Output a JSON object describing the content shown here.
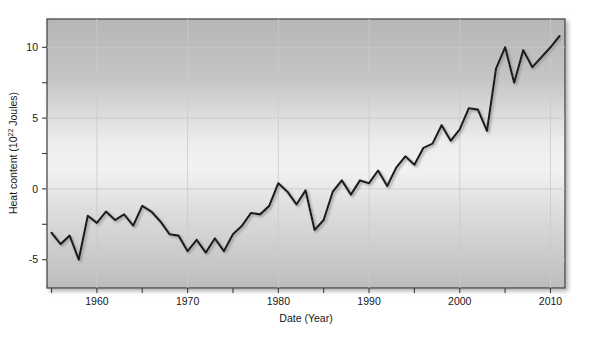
{
  "figure": {
    "background_color": "#ffffff",
    "plot_border_color": "#3b3b3b",
    "gridline_color": "#c9c9c9",
    "line_color": "#1a1a1a",
    "shadow_color": "#9a9a9a"
  },
  "axis": {
    "x_title": "Date (Year)",
    "y_title_main": "Heat content (10",
    "y_title_exp": "22",
    "y_title_tail": " Joules)",
    "x_ticks": [
      "1960",
      "1970",
      "1980",
      "1990",
      "2000",
      "2010"
    ],
    "y_ticks": [
      "10",
      "5",
      "0",
      "-5"
    ]
  },
  "chart_data": {
    "type": "line",
    "title": "",
    "xlabel": "Date (Year)",
    "ylabel": "Heat content (10^22 Joules)",
    "xlim": [
      1954.5,
      2011.6
    ],
    "ylim": [
      -7.0,
      12.0
    ],
    "xticks": [
      1960,
      1970,
      1980,
      1990,
      2000,
      2010
    ],
    "yticks": [
      -5,
      0,
      5,
      10
    ],
    "grid": true,
    "legend": "none",
    "series": [
      {
        "name": "Ocean heat content",
        "x": [
          1955,
          1956,
          1957,
          1958,
          1959,
          1960,
          1961,
          1962,
          1963,
          1964,
          1965,
          1966,
          1967,
          1968,
          1969,
          1970,
          1971,
          1972,
          1973,
          1974,
          1975,
          1976,
          1977,
          1978,
          1979,
          1980,
          1981,
          1982,
          1983,
          1984,
          1985,
          1986,
          1987,
          1988,
          1989,
          1990,
          1991,
          1992,
          1993,
          1994,
          1995,
          1996,
          1997,
          1998,
          1999,
          2000,
          2001,
          2002,
          2003,
          2004,
          2005,
          2006,
          2007,
          2008,
          2009,
          2010,
          2011
        ],
        "values": [
          -3.1,
          -3.9,
          -3.3,
          -5.0,
          -1.9,
          -2.4,
          -1.6,
          -2.2,
          -1.8,
          -2.6,
          -1.2,
          -1.6,
          -2.3,
          -3.2,
          -3.3,
          -4.4,
          -3.6,
          -4.5,
          -3.5,
          -4.4,
          -3.2,
          -2.6,
          -1.7,
          -1.8,
          -1.2,
          0.4,
          -0.2,
          -1.1,
          -0.1,
          -2.9,
          -2.2,
          -0.2,
          0.6,
          -0.4,
          0.6,
          0.4,
          1.3,
          0.2,
          1.5,
          2.3,
          1.7,
          2.9,
          3.2,
          4.5,
          3.4,
          4.2,
          5.7,
          5.6,
          4.1,
          8.5,
          10.0,
          7.5,
          9.8,
          8.6,
          9.3,
          10.0,
          10.8
        ]
      }
    ]
  }
}
